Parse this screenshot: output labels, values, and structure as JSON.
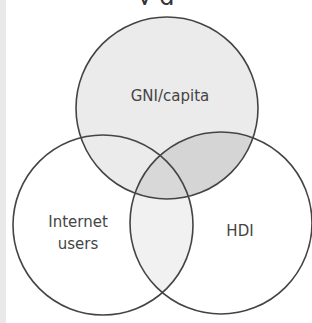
{
  "title_fragment": "y        g",
  "diagram": {
    "type": "venn-3",
    "sets": [
      {
        "id": "gni",
        "label": "GNI/capita",
        "fill": "#ebebeb"
      },
      {
        "id": "internet",
        "label_lines": [
          "Internet",
          "users"
        ],
        "fill": "#ffffff"
      },
      {
        "id": "hdi",
        "label": "HDI",
        "fill": "#ffffff"
      }
    ],
    "overlaps": {
      "gni_hdi": "#d5d5d5",
      "internet_hdi": "#f1f1f1",
      "gni_internet": "#ebebeb",
      "all": "#d8d8d8"
    },
    "stroke_color": "#444444"
  }
}
